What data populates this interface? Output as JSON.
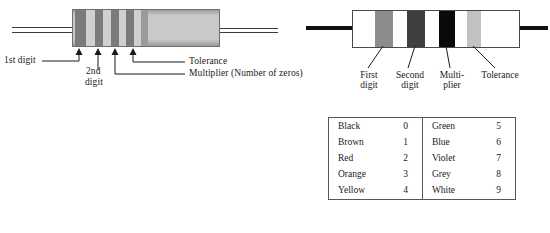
{
  "left_resistor": {
    "name": "shaded-resistor",
    "body_color": "#c9c9c9",
    "bands": [
      {
        "id": "band-1",
        "role": "1st digit",
        "shade": "dark",
        "left": 0,
        "width": 11
      },
      {
        "id": "band-2",
        "role": "spacer",
        "shade": "light",
        "left": 11,
        "width": 8
      },
      {
        "id": "band-3",
        "role": "2nd digit",
        "shade": "dark",
        "left": 19,
        "width": 9
      },
      {
        "id": "band-4",
        "role": "spacer",
        "shade": "light",
        "left": 28,
        "width": 8
      },
      {
        "id": "band-5",
        "role": "multiplier",
        "shade": "dark",
        "left": 36,
        "width": 8
      },
      {
        "id": "band-6",
        "role": "spacer",
        "shade": "light",
        "left": 44,
        "width": 7
      },
      {
        "id": "band-7",
        "role": "tolerance",
        "shade": "dark",
        "left": 51,
        "width": 8
      },
      {
        "id": "band-8",
        "role": "gap",
        "shade": "light",
        "left": 59,
        "width": 7
      },
      {
        "id": "band-9",
        "role": "edge",
        "shade": "mid",
        "left": 66,
        "width": 7
      }
    ],
    "labels": {
      "first_digit": "1st digit",
      "second_digit_line1": "2nd",
      "second_digit_line2": "digit",
      "tolerance": "Tolerance",
      "multiplier": "Multiplier  (Number of zeros)"
    }
  },
  "right_resistor": {
    "name": "line-art-resistor",
    "body_color": "#ffffff",
    "bands": [
      {
        "id": "band-first",
        "role": "First digit",
        "color": "#8c8c8c",
        "left": 22,
        "width": 18
      },
      {
        "id": "band-second",
        "role": "Second digit",
        "color": "#3f3f3f",
        "left": 54,
        "width": 18
      },
      {
        "id": "band-multiplier",
        "role": "Multiplier",
        "color": "#0a0a0a",
        "left": 86,
        "width": 16
      },
      {
        "id": "band-tolerance",
        "role": "Tolerance",
        "color": "#c2c2c2",
        "left": 114,
        "width": 14
      }
    ],
    "labels": {
      "first_line1": "First",
      "first_line2": "digit",
      "second_line1": "Second",
      "second_line2": "digit",
      "multiplier_line1": "Multi-",
      "multiplier_line2": "plier",
      "tolerance_line1": "Tolerance"
    }
  },
  "color_table": {
    "name": "resistor-colour-value-table",
    "rows": [
      {
        "color_left": "Black",
        "value_left": "0",
        "color_right": "Green",
        "value_right": "5"
      },
      {
        "color_left": "Brown",
        "value_left": "1",
        "color_right": "Blue",
        "value_right": "6"
      },
      {
        "color_left": "Red",
        "value_left": "2",
        "color_right": "Violet",
        "value_right": "7"
      },
      {
        "color_left": "Orange",
        "value_left": "3",
        "color_right": "Grey",
        "value_right": "8"
      },
      {
        "color_left": "Yellow",
        "value_left": "4",
        "color_right": "White",
        "value_right": "9"
      }
    ]
  }
}
